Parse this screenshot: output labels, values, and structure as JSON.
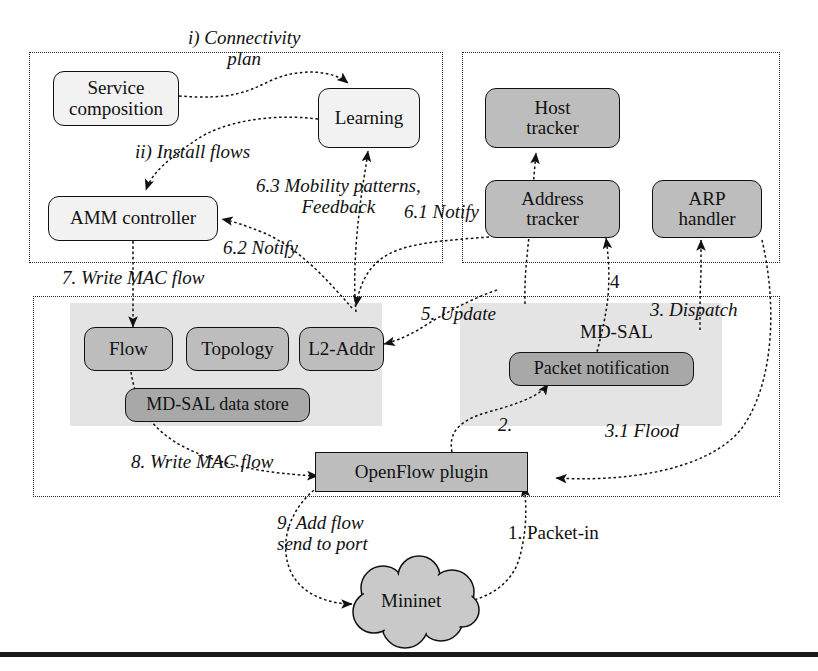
{
  "diagram": {
    "colors": {
      "node_light": "#f2f2f2",
      "node_grey": "#bdbdbd",
      "node_grey_dark": "#a8a8a8",
      "shade": "#e4e4e4",
      "stroke": "#111111"
    },
    "nodes": {
      "service_composition": "Service composition",
      "learning": "Learning",
      "amm_controller": "AMM controller",
      "host_tracker": "Host tracker",
      "address_tracker": "Address tracker",
      "arp_handler": "ARP handler",
      "flow": "Flow",
      "topology": "Topology",
      "l2_addr": "L2-Addr",
      "md_sal_data_store": "MD-SAL data store",
      "packet_notification": "Packet notification",
      "openflow_plugin": "OpenFlow plugin",
      "mininet": "Mininet"
    },
    "node_lines": {
      "service_composition": [
        "Service",
        "composition"
      ],
      "host_tracker": [
        "Host",
        "tracker"
      ],
      "address_tracker": [
        "Address",
        "tracker"
      ],
      "arp_handler": [
        "ARP",
        "handler"
      ]
    },
    "region_labels": {
      "md_sal": "MD-SAL"
    },
    "edge_labels": {
      "i_connectivity_plan": [
        "i) Connectivity",
        "plan"
      ],
      "ii_install_flows": "ii) Install flows",
      "six_three_mobility": [
        "6.3 Mobility patterns,",
        "Feedback"
      ],
      "six_two_notify": "6.2 Notify",
      "six_one_notify": "6.1 Notify",
      "seven_write_mac_flow": "7. Write MAC flow",
      "eight_write_mac_flow": "8. Write MAC flow",
      "five_update": "5. Update",
      "four": "4",
      "three_dispatch": "3. Dispatch",
      "three_one_flood": "3.1 Flood",
      "two": "2.",
      "one_packet_in": "1. Packet-in",
      "nine_add_flow": [
        "9. Add flow",
        "send to port"
      ]
    }
  }
}
